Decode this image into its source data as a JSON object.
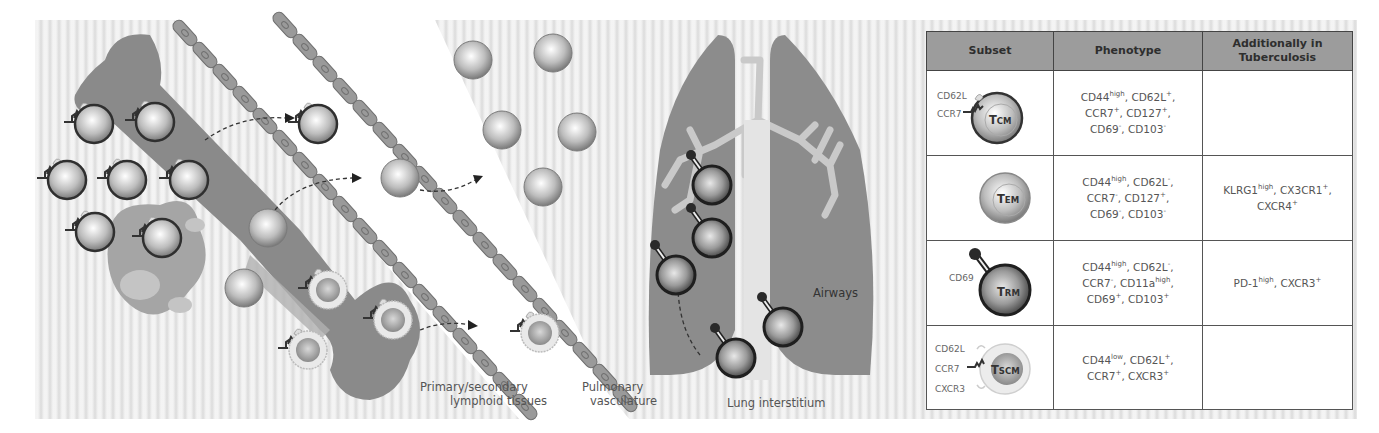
{
  "illustration": {
    "labels": {
      "lymphoid_line1": "Primary/secondary",
      "lymphoid_line2": "lymphoid tissues",
      "vasculature_line1": "Pulmonary",
      "vasculature_line2": "vasculature",
      "interstitium": "Lung interstitium",
      "airways": "Airways"
    },
    "colors": {
      "background": "#e6e6e6",
      "tissue": "#8a8a8a",
      "vessel_wall": "#9a9a9a",
      "vessel_lumen": "#ffffff",
      "lung": "#8c8c8c",
      "airway_tree": "#c9c9c9",
      "cell_dark_rim": "#3a3a3a"
    }
  },
  "table": {
    "headers": [
      "Subset",
      "Phenotype",
      "Additionally in Tuberculosis"
    ],
    "header_color": "#9c9c9c",
    "rows": [
      {
        "subset": "TCM",
        "subset_main": "T",
        "subset_sub": "CM",
        "markers": [
          "CD62L",
          "CCR7"
        ],
        "phenotype_html": "CD44<sup>high</sup>, CD62L<sup>+</sup>,<br>CCR7<sup>+</sup>, CD127<sup>+</sup>,<br>CD69<sup>-</sup>, CD103<sup>-</sup>",
        "phenotype": "CD44high, CD62L+, CCR7+, CD127+, CD69-, CD103-",
        "tuberculosis_html": "",
        "tuberculosis": ""
      },
      {
        "subset": "TEM",
        "subset_main": "T",
        "subset_sub": "EM",
        "markers": [],
        "phenotype_html": "CD44<sup>high</sup>, CD62L<sup>-</sup>,<br>CCR7<sup>-</sup>, CD127<sup>+</sup>,<br>CD69<sup>-</sup>, CD103<sup>-</sup>",
        "phenotype": "CD44high, CD62L-, CCR7-, CD127+, CD69-, CD103-",
        "tuberculosis_html": "KLRG1<sup>high</sup>, CX3CR1<sup>+</sup>,<br>CXCR4<sup>+</sup>",
        "tuberculosis": "KLRG1high, CX3CR1+, CXCR4+"
      },
      {
        "subset": "TRM",
        "subset_main": "T",
        "subset_sub": "RM",
        "markers": [
          "CD69"
        ],
        "phenotype_html": "CD44<sup>high</sup>, CD62L<sup>-</sup>,<br>CCR7<sup>-</sup>, CD11a<sup>high</sup>,<br>CD69<sup>+</sup>, CD103<sup>+</sup>",
        "phenotype": "CD44high, CD62L-, CCR7-, CD11ahigh, CD69+, CD103+",
        "tuberculosis_html": "PD-1<sup>high</sup>, CXCR3<sup>+</sup>",
        "tuberculosis": "PD-1high, CXCR3+"
      },
      {
        "subset": "TSCM",
        "subset_main": "T",
        "subset_sub": "SCM",
        "markers": [
          "CD62L",
          "CCR7",
          "CXCR3"
        ],
        "phenotype_html": "CD44<sup>low</sup>, CD62L<sup>+</sup>,<br>CCR7<sup>+</sup>, CXCR3<sup>+</sup>",
        "phenotype": "CD44low, CD62L+, CCR7+, CXCR3+",
        "tuberculosis_html": "",
        "tuberculosis": ""
      }
    ]
  }
}
